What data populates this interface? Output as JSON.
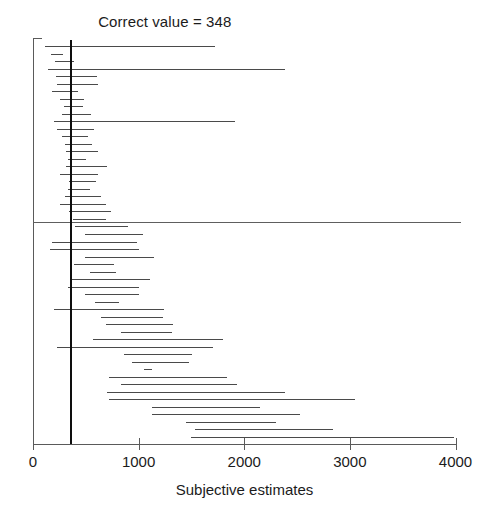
{
  "figure": {
    "title": "Correct value = 348",
    "x_axis_label": "Subjective estimates",
    "correct_value_label": "348"
  },
  "chart_data": {
    "type": "bar",
    "subtype": "interval-caterpillar-plot",
    "title": "Correct value = 348",
    "xlabel": "Subjective estimates",
    "ylabel": "",
    "xlim": [
      0,
      4000
    ],
    "ylim": [
      0,
      46
    ],
    "grid": false,
    "legend": null,
    "xticks": [
      0,
      1000,
      2000,
      3000,
      4000
    ],
    "xtick_labels": [
      "0",
      "1000",
      "2000",
      "3000",
      "4000"
    ],
    "reference_lines": [
      {
        "name": "correct-value",
        "orientation": "vertical",
        "value": 348,
        "label": "Correct value = 348",
        "color": "#0e0e0e"
      },
      {
        "name": "median-separator",
        "orientation": "horizontal",
        "index": 23,
        "color": "#5e5e5e"
      }
    ],
    "series": [
      {
        "name": "Subjective estimate intervals",
        "color": "#4a4a4a",
        "intervals": [
          {
            "index": 1,
            "low": 110,
            "high": 1720
          },
          {
            "index": 2,
            "low": 175,
            "high": 285
          },
          {
            "index": 3,
            "low": 205,
            "high": 390
          },
          {
            "index": 4,
            "low": 140,
            "high": 2390
          },
          {
            "index": 5,
            "low": 215,
            "high": 605
          },
          {
            "index": 6,
            "low": 225,
            "high": 620
          },
          {
            "index": 7,
            "low": 180,
            "high": 430
          },
          {
            "index": 8,
            "low": 255,
            "high": 480
          },
          {
            "index": 9,
            "low": 290,
            "high": 470
          },
          {
            "index": 10,
            "low": 270,
            "high": 545
          },
          {
            "index": 11,
            "low": 195,
            "high": 1910
          },
          {
            "index": 12,
            "low": 230,
            "high": 580
          },
          {
            "index": 13,
            "low": 275,
            "high": 525
          },
          {
            "index": 14,
            "low": 300,
            "high": 560
          },
          {
            "index": 15,
            "low": 310,
            "high": 615
          },
          {
            "index": 16,
            "low": 330,
            "high": 500
          },
          {
            "index": 17,
            "low": 315,
            "high": 700
          },
          {
            "index": 18,
            "low": 255,
            "high": 620
          },
          {
            "index": 19,
            "low": 345,
            "high": 595
          },
          {
            "index": 20,
            "low": 330,
            "high": 540
          },
          {
            "index": 21,
            "low": 300,
            "high": 640
          },
          {
            "index": 22,
            "low": 260,
            "high": 690
          },
          {
            "index": 23,
            "low": 345,
            "high": 735
          },
          {
            "index": 24,
            "low": 380,
            "high": 690
          },
          {
            "index": 25,
            "low": 400,
            "high": 900
          },
          {
            "index": 26,
            "low": 490,
            "high": 1040
          },
          {
            "index": 27,
            "low": 180,
            "high": 985
          },
          {
            "index": 28,
            "low": 160,
            "high": 1000
          },
          {
            "index": 29,
            "low": 490,
            "high": 1150
          },
          {
            "index": 30,
            "low": 390,
            "high": 770
          },
          {
            "index": 31,
            "low": 540,
            "high": 790
          },
          {
            "index": 32,
            "low": 350,
            "high": 1105
          },
          {
            "index": 33,
            "low": 330,
            "high": 1000
          },
          {
            "index": 34,
            "low": 490,
            "high": 1005
          },
          {
            "index": 35,
            "low": 590,
            "high": 810
          },
          {
            "index": 36,
            "low": 200,
            "high": 1240
          },
          {
            "index": 37,
            "low": 640,
            "high": 1230
          },
          {
            "index": 38,
            "low": 690,
            "high": 1330
          },
          {
            "index": 39,
            "low": 830,
            "high": 1320
          },
          {
            "index": 40,
            "low": 570,
            "high": 1800
          },
          {
            "index": 41,
            "low": 225,
            "high": 1700
          },
          {
            "index": 42,
            "low": 860,
            "high": 1510
          },
          {
            "index": 43,
            "low": 940,
            "high": 1480
          },
          {
            "index": 44,
            "low": 1050,
            "high": 1130
          },
          {
            "index": 45,
            "low": 720,
            "high": 1840
          },
          {
            "index": 46,
            "low": 830,
            "high": 1930
          },
          {
            "index": 47,
            "low": 700,
            "high": 2390
          },
          {
            "index": 48,
            "low": 720,
            "high": 3050
          },
          {
            "index": 49,
            "low": 1130,
            "high": 2150
          },
          {
            "index": 50,
            "low": 1130,
            "high": 2530
          },
          {
            "index": 51,
            "low": 1450,
            "high": 2300
          },
          {
            "index": 52,
            "low": 1530,
            "high": 2840
          },
          {
            "index": 53,
            "low": 1500,
            "high": 3990
          }
        ]
      }
    ]
  }
}
